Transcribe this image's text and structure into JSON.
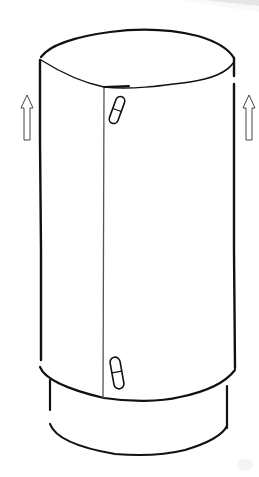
{
  "figure": {
    "colors": {
      "background": "#ffffff",
      "line": "#111111",
      "seam": "#555555",
      "arrow_outline": "#444444",
      "page_curl": "#d6d6d6"
    },
    "elements": {
      "top_lid": "ellipse",
      "body": "cylinder wall",
      "seam": "vertical seam line",
      "latch_top": "capsule latch",
      "latch_bottom": "capsule latch",
      "base_ring": "lower base ring",
      "arrow_left": "up-arrow-icon",
      "arrow_right": "up-arrow-icon"
    }
  }
}
